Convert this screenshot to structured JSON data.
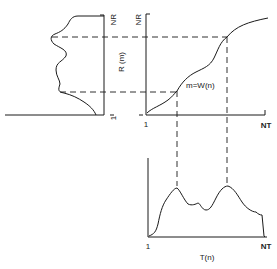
{
  "diagram": {
    "title": "",
    "left_plot": {
      "axis_top_label": "NR",
      "axis_bottom_label": "1",
      "axis_label": "R (m)"
    },
    "mapping_plot": {
      "y_top_label": "NR",
      "x_start_label": "1",
      "x_end_label": "NT",
      "curve_label": "m=W(n)"
    },
    "bottom_plot": {
      "x_start_label": "1",
      "x_end_label": "NT",
      "axis_label": "T(n)"
    },
    "colors": {
      "line": "#1a1a1a",
      "background": "#ffffff"
    }
  }
}
